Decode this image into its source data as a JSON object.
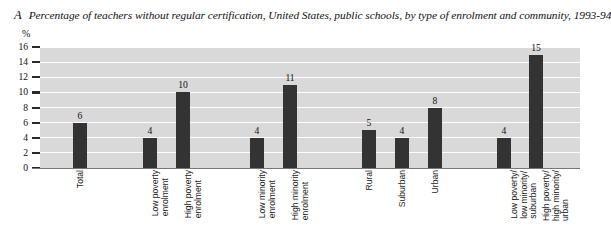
{
  "figure": {
    "letter": "A",
    "title": "Percentage of teachers without regular certification, United States, public schools, by type of enrolment and community, 1993-94"
  },
  "axis": {
    "y_unit": "%",
    "y_ticks": [
      "16",
      "14",
      "12",
      "10",
      "8",
      "6",
      "4",
      "2",
      "0"
    ]
  },
  "colors": {
    "plot_background": "#d9d9d9",
    "gridline": "#fdfdfd",
    "bar": "#333333",
    "page_background": "#ffffff",
    "text": "#111111"
  },
  "chart_data": {
    "type": "bar",
    "title": "Percentage of teachers without regular certification, United States, public schools, by type of enrolment and community, 1993-94",
    "xlabel": "",
    "ylabel": "%",
    "ylim": [
      0,
      16
    ],
    "ytick_step": 2,
    "grid": true,
    "legend": "none",
    "categories": [
      "Total",
      "Low poverty enrolment",
      "High poverty enrolment",
      "Low minority enrolment",
      "High minority enrolment",
      "Rural",
      "Suburban",
      "Urban",
      "Low poverty/ low minority/ suburban",
      "High poverty/ high minority/ urban"
    ],
    "values": [
      6,
      4,
      10,
      4,
      11,
      5,
      4,
      8,
      4,
      15
    ],
    "bars": [
      {
        "label_lines": [
          "Total"
        ],
        "value": 6,
        "value_text": "6",
        "x": 73,
        "width": 14
      },
      {
        "label_lines": [
          "Low poverty",
          "enrolment"
        ],
        "value": 4,
        "value_text": "4",
        "x": 143,
        "width": 14
      },
      {
        "label_lines": [
          "High poverty",
          "enrolment"
        ],
        "value": 10,
        "value_text": "10",
        "x": 176,
        "width": 14
      },
      {
        "label_lines": [
          "Low minority",
          "enrolment"
        ],
        "value": 4,
        "value_text": "4",
        "x": 250,
        "width": 14
      },
      {
        "label_lines": [
          "High minority",
          "enrolment"
        ],
        "value": 11,
        "value_text": "11",
        "x": 283,
        "width": 14
      },
      {
        "label_lines": [
          "Rural"
        ],
        "value": 5,
        "value_text": "5",
        "x": 362,
        "width": 14
      },
      {
        "label_lines": [
          "Suburban"
        ],
        "value": 4,
        "value_text": "4",
        "x": 395,
        "width": 14
      },
      {
        "label_lines": [
          "Urban"
        ],
        "value": 8,
        "value_text": "8",
        "x": 428,
        "width": 14
      },
      {
        "label_lines": [
          "Low poverty/",
          "low minority/",
          "suburban"
        ],
        "value": 4,
        "value_text": "4",
        "x": 497,
        "width": 14
      },
      {
        "label_lines": [
          "High poverty/",
          "high minority/",
          "urban"
        ],
        "value": 15,
        "value_text": "15",
        "x": 529,
        "width": 14
      }
    ]
  }
}
